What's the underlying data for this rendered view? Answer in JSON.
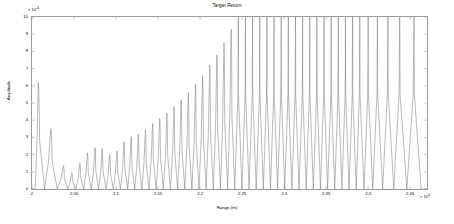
{
  "chart_data": {
    "type": "line",
    "title": "Target Return",
    "xlabel": "Range (m)",
    "ylabel": "Amplitude",
    "x_exponent": "x 10^5",
    "y_exponent": "x 10^-4",
    "xlim": [
      2.0,
      2.47
    ],
    "ylim": [
      0,
      10
    ],
    "grid": false,
    "legend": null,
    "line_color": "#808080",
    "xticks": [
      "2",
      "2.05",
      "2.1",
      "2.15",
      "2.2",
      "2.25",
      "2.3",
      "2.35",
      "2.4",
      "2.45"
    ],
    "xtick_values": [
      2.0,
      2.05,
      2.1,
      2.15,
      2.2,
      2.25,
      2.3,
      2.35,
      2.4,
      2.45
    ],
    "yticks": [
      "0",
      "1",
      "2",
      "3",
      "4",
      "5",
      "6",
      "7",
      "8",
      "9",
      "10"
    ],
    "ytick_values": [
      0,
      1,
      2,
      3,
      4,
      5,
      6,
      7,
      8,
      9,
      10
    ],
    "envelope_peaks": [
      {
        "x": 2.0075,
        "y": 6.2
      },
      {
        "x": 2.0225,
        "y": 3.5
      },
      {
        "x": 2.0375,
        "y": 1.35
      },
      {
        "x": 2.0475,
        "y": 0.95
      },
      {
        "x": 2.057,
        "y": 1.5
      },
      {
        "x": 2.066,
        "y": 2.1
      },
      {
        "x": 2.075,
        "y": 2.4
      },
      {
        "x": 2.0835,
        "y": 2.35
      },
      {
        "x": 2.0925,
        "y": 2.0
      },
      {
        "x": 2.101,
        "y": 2.2
      },
      {
        "x": 2.1095,
        "y": 2.75
      },
      {
        "x": 2.118,
        "y": 3.05
      },
      {
        "x": 2.1265,
        "y": 3.2
      },
      {
        "x": 2.135,
        "y": 3.45
      },
      {
        "x": 2.1435,
        "y": 3.8
      },
      {
        "x": 2.152,
        "y": 4.1
      },
      {
        "x": 2.1605,
        "y": 4.4
      },
      {
        "x": 2.169,
        "y": 4.8
      },
      {
        "x": 2.1775,
        "y": 5.2
      },
      {
        "x": 2.186,
        "y": 5.6
      },
      {
        "x": 2.1945,
        "y": 6.1
      },
      {
        "x": 2.203,
        "y": 6.6
      },
      {
        "x": 2.2115,
        "y": 7.2
      },
      {
        "x": 2.22,
        "y": 7.8
      },
      {
        "x": 2.2285,
        "y": 8.5
      },
      {
        "x": 2.237,
        "y": 9.3
      },
      {
        "x": 2.2455,
        "y": 10.0
      },
      {
        "x": 2.254,
        "y": 10.0
      },
      {
        "x": 2.2625,
        "y": 10.0
      },
      {
        "x": 2.271,
        "y": 10.0
      },
      {
        "x": 2.2795,
        "y": 10.0
      },
      {
        "x": 2.288,
        "y": 10.0
      },
      {
        "x": 2.2965,
        "y": 10.0
      },
      {
        "x": 2.305,
        "y": 10.0
      },
      {
        "x": 2.3135,
        "y": 10.0
      },
      {
        "x": 2.322,
        "y": 10.0
      },
      {
        "x": 2.3305,
        "y": 10.0
      },
      {
        "x": 2.339,
        "y": 10.0
      },
      {
        "x": 2.3475,
        "y": 10.0
      },
      {
        "x": 2.356,
        "y": 10.0
      },
      {
        "x": 2.3645,
        "y": 10.0
      },
      {
        "x": 2.373,
        "y": 10.0
      },
      {
        "x": 2.3815,
        "y": 10.0
      },
      {
        "x": 2.39,
        "y": 10.0
      },
      {
        "x": 2.4,
        "y": 10.0
      },
      {
        "x": 2.411,
        "y": 10.0
      },
      {
        "x": 2.4235,
        "y": 10.0
      },
      {
        "x": 2.4375,
        "y": 10.0
      },
      {
        "x": 2.4545,
        "y": 10.0
      }
    ],
    "trough_value": 0.0
  }
}
